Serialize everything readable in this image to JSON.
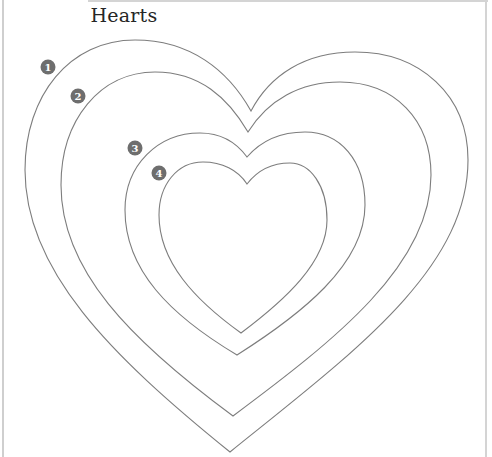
{
  "title": "Hearts",
  "colors": {
    "outline": "#7d7d7d",
    "badge_fill": "#6e6e6e",
    "badge_text": "#ffffff",
    "title_text": "#262626",
    "frame": "#d4d4d4"
  },
  "hearts": [
    {
      "label": "1",
      "badge": {
        "cx": 48,
        "cy": 67
      },
      "path": "M251,111 C228,70 190,40 135,40 C70,40 25,95 25,170 C25,270 110,355 230,452 C350,355 468,270 468,160 C468,95 420,52 355,52 C305,52 270,75 251,111 Z"
    },
    {
      "label": "2",
      "badge": {
        "cx": 78,
        "cy": 96
      },
      "path": "M248,132 C228,98 200,72 155,72 C100,72 61,120 61,185 C61,270 130,340 233,416 C335,340 431,265 431,175 C431,120 395,82 340,82 C300,82 268,100 248,132 Z"
    },
    {
      "label": "3",
      "badge": {
        "cx": 135,
        "cy": 148
      },
      "path": "M247,157 C236,142 220,133 200,133 C158,133 125,165 125,210 C125,270 170,315 237,355 C300,315 365,265 365,205 C365,160 340,132 305,132 C280,132 260,142 247,157 Z"
    },
    {
      "label": "4",
      "badge": {
        "cx": 159,
        "cy": 173
      },
      "path": "M247,184 C238,170 222,162 203,162 C177,162 159,185 159,215 C159,262 195,300 241,333 C285,300 327,262 327,220 C327,185 310,163 290,163 C272,163 257,171 247,184 Z"
    }
  ]
}
